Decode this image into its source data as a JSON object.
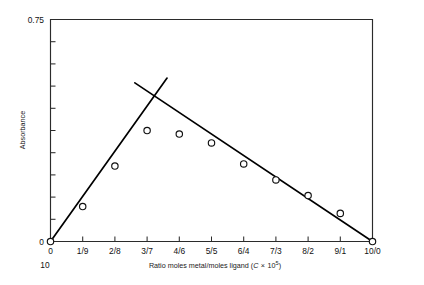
{
  "chart_data": {
    "type": "scatter",
    "title": "",
    "xlabel": "Ratio moles metal/moles ligand (C × 10⁵)",
    "xlabel_parts": {
      "lead": "Ratio moles metal/moles ligand (",
      "italic_var": "C",
      "times": "×",
      "base": "10",
      "exponent": "5",
      "close": ")"
    },
    "ylabel": "Absorbance",
    "xlim": [
      0,
      10
    ],
    "ylim": [
      0,
      0.75
    ],
    "grid": false,
    "legend": null,
    "x_tick_labels": [
      "0",
      "1/9",
      "2/8",
      "3/7",
      "4/6",
      "5/5",
      "6/4",
      "7/3",
      "8/2",
      "9/1",
      "10/0"
    ],
    "x_tick_values": [
      0,
      1,
      2,
      3,
      4,
      5,
      6,
      7,
      8,
      9,
      10
    ],
    "x_secondary_label": "10",
    "y_tick_labels": [
      "0",
      "0.75"
    ],
    "y_labeled_values": [
      0,
      0.75
    ],
    "y_minor_tick_count": 9,
    "marker_style": "open-circle",
    "points": [
      {
        "x": 0,
        "y": 0.0,
        "label": "0"
      },
      {
        "x": 1,
        "y": 0.118,
        "label": "1/9"
      },
      {
        "x": 2,
        "y": 0.255,
        "label": "2/8"
      },
      {
        "x": 3,
        "y": 0.375,
        "label": "3/7"
      },
      {
        "x": 4,
        "y": 0.363,
        "label": "4/6"
      },
      {
        "x": 5,
        "y": 0.333,
        "label": "5/5"
      },
      {
        "x": 6,
        "y": 0.262,
        "label": "6/4"
      },
      {
        "x": 7,
        "y": 0.208,
        "label": "7/3"
      },
      {
        "x": 8,
        "y": 0.155,
        "label": "8/2"
      },
      {
        "x": 9,
        "y": 0.095,
        "label": "9/1"
      },
      {
        "x": 10,
        "y": 0.0,
        "label": "10/0"
      }
    ],
    "series": [
      {
        "name": "ascending-fit",
        "type": "line",
        "from": {
          "x": 0.0,
          "y": 0.0
        },
        "to": {
          "x": 3.62,
          "y": 0.552
        }
      },
      {
        "name": "descending-fit",
        "type": "line",
        "from": {
          "x": 2.62,
          "y": 0.536
        },
        "to": {
          "x": 10.0,
          "y": 0.0
        }
      }
    ],
    "annotations": [
      {
        "name": "intersection",
        "x": 3.22,
        "y": 0.49,
        "text": ""
      }
    ]
  },
  "colors": {
    "axis": "#2b2b2b",
    "line": "#000000",
    "marker_fill": "#ffffff",
    "marker_edge": "#111111",
    "background": "#ffffff",
    "text": "#111111"
  }
}
